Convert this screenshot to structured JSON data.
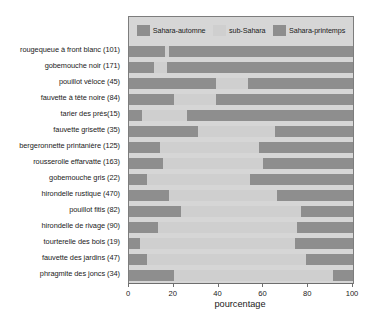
{
  "chart_data": {
    "type": "bar",
    "orientation": "horizontal",
    "stacked": true,
    "stack_total": 100,
    "title": "",
    "xlabel": "pourcentage",
    "ylabel": "",
    "xlim": [
      0,
      100
    ],
    "xticks": [
      0,
      20,
      40,
      60,
      80,
      100
    ],
    "grid": false,
    "legend_position": "top-inside",
    "categories": [
      "rougequeue à front blanc (101)",
      "gobemouche noir (171)",
      "pouillot véloce (45)",
      "fauvette à tête noire (84)",
      "tarier des prés(15)",
      "fauvette grisette (35)",
      "bergeronnette printanière (125)",
      "rousserolle effarvatte (163)",
      "gobemouche gris (22)",
      "hirondelle rustique (470)",
      "pouillot fitis (82)",
      "hirondelle de rivage (90)",
      "tourterelle des bois (19)",
      "fauvette des jardins (47)",
      "phragmite des joncs (34)"
    ],
    "series": [
      {
        "name": "Sahara-automne",
        "color": "#8e8e8e",
        "values": [
          16,
          11,
          39,
          20,
          6,
          31,
          14,
          15,
          8,
          18,
          23,
          13,
          5,
          8,
          20
        ]
      },
      {
        "name": "sub-Sahara",
        "color": "#cfcfcf",
        "values": [
          2,
          6,
          14,
          19,
          20,
          34,
          44,
          45,
          46,
          48,
          54,
          62,
          69,
          71,
          71
        ]
      },
      {
        "name": "Sahara-printemps",
        "color": "#8e8e8e",
        "values": [
          82,
          83,
          47,
          61,
          74,
          35,
          42,
          40,
          46,
          34,
          23,
          25,
          26,
          21,
          9
        ]
      }
    ]
  },
  "legend": {
    "entries": [
      {
        "label": "Sahara-automne"
      },
      {
        "label": "sub-Sahara"
      },
      {
        "label": "Sahara-printemps"
      }
    ]
  },
  "axis": {
    "x_title": "pourcentage",
    "x_tick_labels": [
      "0",
      "20",
      "40",
      "60",
      "80",
      "100"
    ]
  },
  "colors": {
    "dark": "#8e8e8e",
    "light": "#cfcfcf",
    "plot_background": "#d6d6d6",
    "axis": "#6e6e6e",
    "text": "#1a1a1a"
  }
}
